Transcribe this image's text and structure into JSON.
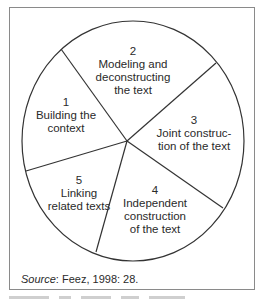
{
  "diagram": {
    "type": "cycle",
    "stroke_color": "#333333",
    "frame_color": "#8a8a8a",
    "segments": [
      {
        "number": "1",
        "lines": [
          "Building the",
          "context"
        ]
      },
      {
        "number": "2",
        "lines": [
          "Modeling and",
          "deconstructing",
          "the text"
        ]
      },
      {
        "number": "3",
        "lines": [
          "Joint construc-",
          "tion of the text"
        ]
      },
      {
        "number": "4",
        "lines": [
          "Independent",
          "construction",
          "of the text"
        ]
      },
      {
        "number": "5",
        "lines": [
          "Linking",
          "related texts"
        ]
      }
    ]
  },
  "source": {
    "label": "Source",
    "citation": ": Feez, 1998: 28."
  }
}
